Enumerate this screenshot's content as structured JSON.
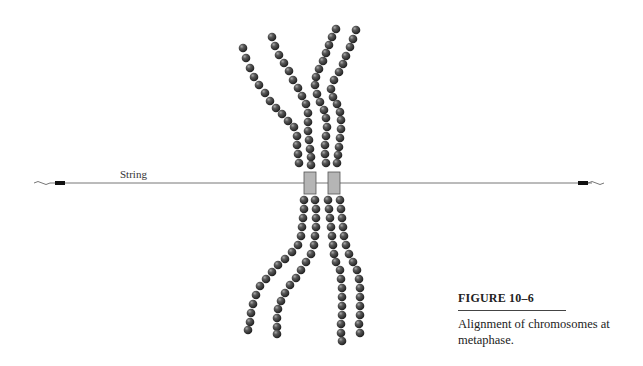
{
  "figure": {
    "string_label": "String",
    "caption_title": "FIGURE 10–6",
    "caption_text": "Alignment of chromosomes at metaphase.",
    "colors": {
      "bead": "#3a3a3a",
      "bead_highlight": "#9a9a9a",
      "string": "#777777",
      "kinetochore_fill": "#b5b5b5",
      "kinetochore_stroke": "#555555",
      "string_end": "#111111"
    },
    "string": {
      "y": 183,
      "x1": 50,
      "x2": 592
    },
    "kinetochores": [
      {
        "x": 304,
        "y": 172,
        "w": 12,
        "h": 22
      },
      {
        "x": 328,
        "y": 172,
        "w": 12,
        "h": 22
      }
    ],
    "chromatids": [
      {
        "name": "upper-left-outer",
        "points": [
          [
            243,
            48
          ],
          [
            246,
            58
          ],
          [
            250,
            68
          ],
          [
            254,
            77
          ],
          [
            259,
            85
          ],
          [
            265,
            93
          ],
          [
            270,
            101
          ],
          [
            276,
            108
          ],
          [
            282,
            114
          ],
          [
            288,
            121
          ],
          [
            294,
            127
          ],
          [
            297,
            136
          ],
          [
            297,
            145
          ],
          [
            298,
            154
          ],
          [
            299,
            163
          ]
        ]
      },
      {
        "name": "upper-left-inner",
        "points": [
          [
            272,
            37
          ],
          [
            275,
            46
          ],
          [
            279,
            55
          ],
          [
            284,
            63
          ],
          [
            289,
            71
          ],
          [
            293,
            80
          ],
          [
            298,
            88
          ],
          [
            302,
            96
          ],
          [
            306,
            104
          ],
          [
            308,
            113
          ],
          [
            308,
            122
          ],
          [
            308,
            131
          ],
          [
            309,
            140
          ],
          [
            310,
            149
          ],
          [
            311,
            157
          ],
          [
            311,
            165
          ]
        ]
      },
      {
        "name": "upper-right-inner",
        "points": [
          [
            336,
            29
          ],
          [
            332,
            37
          ],
          [
            329,
            45
          ],
          [
            326,
            53
          ],
          [
            323,
            61
          ],
          [
            319,
            69
          ],
          [
            316,
            77
          ],
          [
            315,
            85
          ],
          [
            317,
            94
          ],
          [
            320,
            102
          ],
          [
            324,
            110
          ],
          [
            326,
            118
          ],
          [
            327,
            127
          ],
          [
            326,
            136
          ],
          [
            325,
            145
          ],
          [
            325,
            154
          ],
          [
            326,
            163
          ]
        ]
      },
      {
        "name": "upper-right-outer",
        "points": [
          [
            356,
            30
          ],
          [
            353,
            39
          ],
          [
            350,
            47
          ],
          [
            346,
            56
          ],
          [
            343,
            64
          ],
          [
            339,
            72
          ],
          [
            334,
            80
          ],
          [
            331,
            89
          ],
          [
            333,
            97
          ],
          [
            337,
            104
          ],
          [
            340,
            112
          ],
          [
            341,
            120
          ],
          [
            341,
            129
          ],
          [
            340,
            138
          ],
          [
            339,
            147
          ],
          [
            338,
            155
          ],
          [
            337,
            163
          ]
        ]
      },
      {
        "name": "lower-left-outer",
        "points": [
          [
            304,
            200
          ],
          [
            304,
            209
          ],
          [
            303,
            218
          ],
          [
            302,
            227
          ],
          [
            301,
            236
          ],
          [
            298,
            245
          ],
          [
            292,
            252
          ],
          [
            285,
            259
          ],
          [
            278,
            265
          ],
          [
            272,
            272
          ],
          [
            266,
            279
          ],
          [
            260,
            286
          ],
          [
            256,
            295
          ],
          [
            253,
            304
          ],
          [
            251,
            313
          ],
          [
            250,
            322
          ],
          [
            248,
            330
          ]
        ]
      },
      {
        "name": "lower-left-inner",
        "points": [
          [
            315,
            200
          ],
          [
            316,
            209
          ],
          [
            316,
            218
          ],
          [
            316,
            227
          ],
          [
            315,
            236
          ],
          [
            314,
            245
          ],
          [
            311,
            254
          ],
          [
            306,
            262
          ],
          [
            301,
            270
          ],
          [
            296,
            278
          ],
          [
            290,
            285
          ],
          [
            285,
            293
          ],
          [
            281,
            301
          ],
          [
            278,
            309
          ],
          [
            277,
            318
          ],
          [
            277,
            327
          ],
          [
            277,
            334
          ]
        ]
      },
      {
        "name": "lower-right-inner",
        "points": [
          [
            328,
            200
          ],
          [
            329,
            209
          ],
          [
            330,
            218
          ],
          [
            331,
            227
          ],
          [
            332,
            236
          ],
          [
            333,
            245
          ],
          [
            334,
            254
          ],
          [
            336,
            262
          ],
          [
            340,
            270
          ],
          [
            341,
            279
          ],
          [
            342,
            288
          ],
          [
            342,
            297
          ],
          [
            342,
            306
          ],
          [
            342,
            315
          ],
          [
            341,
            324
          ],
          [
            341,
            333
          ],
          [
            342,
            341
          ]
        ]
      },
      {
        "name": "lower-right-outer",
        "points": [
          [
            340,
            200
          ],
          [
            341,
            209
          ],
          [
            342,
            218
          ],
          [
            343,
            227
          ],
          [
            344,
            236
          ],
          [
            346,
            245
          ],
          [
            349,
            254
          ],
          [
            353,
            262
          ],
          [
            357,
            270
          ],
          [
            359,
            279
          ],
          [
            360,
            288
          ],
          [
            360,
            297
          ],
          [
            360,
            306
          ],
          [
            360,
            315
          ],
          [
            359,
            324
          ],
          [
            360,
            333
          ]
        ]
      }
    ]
  }
}
